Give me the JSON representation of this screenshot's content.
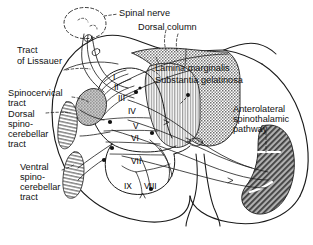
{
  "figure": {
    "colors": {
      "outline": "#1a1a1a",
      "text": "#111111",
      "dorsal_column_fill": "#b9b9b9",
      "substantia_gelatinosa_fill": "#cfcfcf",
      "spinocervical_fill": "#a8a8a8",
      "dorsal_spinocerebellar_fill": "#c4c4c4",
      "ventral_spinocerebellar_fill": "#cccccc",
      "anterolateral_fill": "#8d8d8d",
      "background": "#ffffff"
    }
  },
  "labels": {
    "spinal_nerve": "Spinal nerve",
    "dorsal_column": "Dorsal column",
    "lamina_marginalis": "Lamina marginalis",
    "substantia_gelatinosa": "Substantia gelatinosa",
    "tract_of_lissauer_line1": "Tract",
    "tract_of_lissauer_line2": "of Lissauer",
    "spinocervical_line1": "Spinocervical",
    "spinocervical_line2": "tract",
    "dorsal_spinocerebellar_line1": "Dorsal",
    "dorsal_spinocerebellar_line2": "spino-",
    "dorsal_spinocerebellar_line3": "cerebellar",
    "dorsal_spinocerebellar_line4": "tract",
    "ventral_spinocerebellar_line1": "Ventral",
    "ventral_spinocerebellar_line2": "spino-",
    "ventral_spinocerebellar_line3": "cerebellar",
    "ventral_spinocerebellar_line4": "tract",
    "anterolateral_line1": "Anterolateral",
    "anterolateral_line2": "spinothalamic",
    "anterolateral_line3": "pathway"
  },
  "laminae": [
    {
      "id": "lamina-1",
      "numeral": "I"
    },
    {
      "id": "lamina-2",
      "numeral": "II"
    },
    {
      "id": "lamina-3",
      "numeral": "III"
    },
    {
      "id": "lamina-4",
      "numeral": "IV"
    },
    {
      "id": "lamina-5",
      "numeral": "V"
    },
    {
      "id": "lamina-6",
      "numeral": "VI"
    },
    {
      "id": "lamina-7",
      "numeral": "VII"
    },
    {
      "id": "lamina-8",
      "numeral": "VIII"
    },
    {
      "id": "lamina-9",
      "numeral": "IX"
    }
  ]
}
